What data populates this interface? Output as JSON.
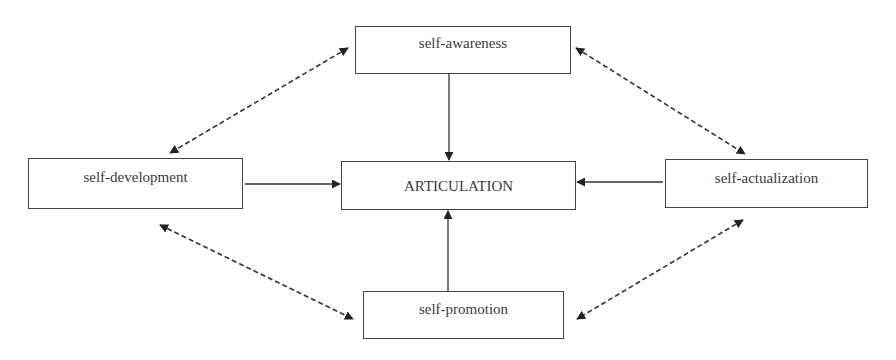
{
  "diagram": {
    "type": "concept-map",
    "colors": {
      "line": "#333333",
      "box_border": "#444444",
      "text": "#3a3a3a",
      "background": "#ffffff"
    },
    "nodes": [
      {
        "id": "awareness",
        "label": "self-awareness",
        "x": 355,
        "y": 26,
        "w": 216,
        "h": 48,
        "text_top": 8
      },
      {
        "id": "development",
        "label": "self-development",
        "x": 28,
        "y": 158,
        "w": 215,
        "h": 51,
        "text_top": 10
      },
      {
        "id": "articulation",
        "label": "ARTICULATION",
        "x": 341,
        "y": 161,
        "w": 235,
        "h": 49,
        "text_top": 16
      },
      {
        "id": "actualization",
        "label": "self-actualization",
        "x": 665,
        "y": 159,
        "w": 203,
        "h": 49,
        "text_top": 10
      },
      {
        "id": "promotion",
        "label": "self-promotion",
        "x": 363,
        "y": 291,
        "w": 201,
        "h": 48,
        "text_top": 9
      }
    ],
    "edges": [
      {
        "from": "awareness",
        "to": "articulation",
        "style": "solid",
        "direction": "one-way",
        "x1": 449,
        "y1": 74,
        "x2": 449,
        "y2": 160
      },
      {
        "from": "development",
        "to": "articulation",
        "style": "solid",
        "direction": "one-way",
        "x1": 245,
        "y1": 184,
        "x2": 340,
        "y2": 184
      },
      {
        "from": "actualization",
        "to": "articulation",
        "style": "solid",
        "direction": "one-way",
        "x1": 663,
        "y1": 182,
        "x2": 577,
        "y2": 182
      },
      {
        "from": "promotion",
        "to": "articulation",
        "style": "solid",
        "direction": "one-way",
        "x1": 448,
        "y1": 291,
        "x2": 448,
        "y2": 211
      },
      {
        "from": "awareness",
        "to": "development",
        "style": "dashed",
        "direction": "two-way",
        "x1": 348,
        "y1": 48,
        "x2": 170,
        "y2": 153
      },
      {
        "from": "awareness",
        "to": "actualization",
        "style": "dashed",
        "direction": "two-way",
        "x1": 576,
        "y1": 48,
        "x2": 745,
        "y2": 154
      },
      {
        "from": "development",
        "to": "promotion",
        "style": "dashed",
        "direction": "two-way",
        "x1": 160,
        "y1": 225,
        "x2": 353,
        "y2": 319
      },
      {
        "from": "actualization",
        "to": "promotion",
        "style": "dashed",
        "direction": "two-way",
        "x1": 743,
        "y1": 220,
        "x2": 577,
        "y2": 319
      }
    ]
  }
}
